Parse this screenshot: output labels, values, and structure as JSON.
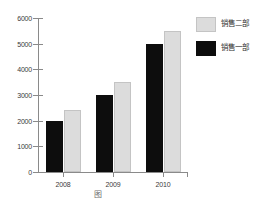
{
  "chart_data": {
    "type": "bar",
    "title": "",
    "xlabel": "",
    "ylabel": "",
    "categories": [
      "2008",
      "2009",
      "2010"
    ],
    "series": [
      {
        "name": "销售一部",
        "color": "#0d0d0d",
        "values": [
          2000,
          3000,
          5000
        ]
      },
      {
        "name": "销售二部",
        "color": "#dcdcdc",
        "values": [
          2400,
          3500,
          5500
        ]
      }
    ],
    "ylim": [
      0,
      6000
    ],
    "yticks": [
      0,
      1000,
      2000,
      3000,
      4000,
      5000,
      6000
    ],
    "ytick_labels": [
      "0",
      "1000",
      "2000",
      "3000",
      "4000",
      "5000",
      "6000"
    ],
    "grid": false,
    "legend_position": "upper right",
    "legend_entries": [
      "销售二部",
      "销售一部"
    ]
  },
  "axes": {
    "y_labels": [
      "6000",
      "5000",
      "4000",
      "3000",
      "2000",
      "1000",
      "0"
    ],
    "x_labels": [
      "2008",
      "2009",
      "2010"
    ]
  },
  "legend": {
    "rows": [
      {
        "label": "销售二部",
        "swatch": "light-gray-swatch"
      },
      {
        "label": "销售一部",
        "swatch": "black-swatch"
      }
    ]
  },
  "caption": {
    "text": "图"
  }
}
